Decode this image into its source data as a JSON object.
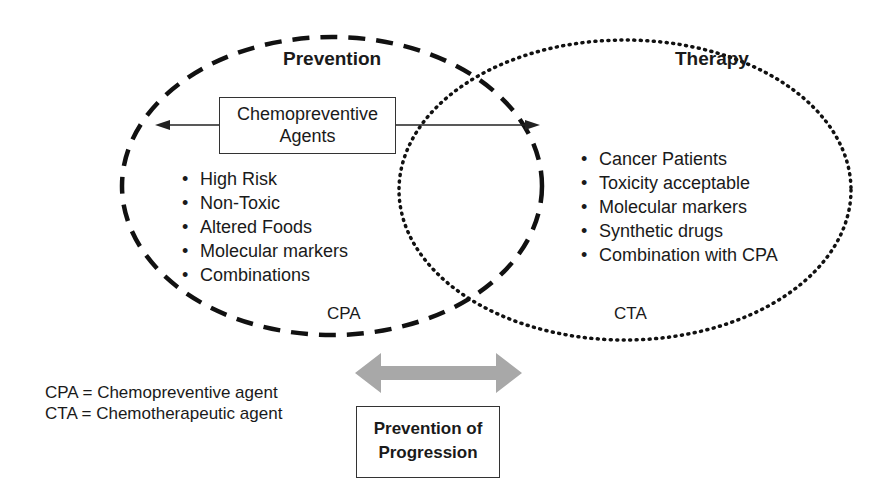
{
  "prevention": {
    "heading": "Prevention",
    "agents_box": {
      "line1": "Chemopreventive",
      "line2": "Agents"
    },
    "items": [
      "High Risk",
      "Non-Toxic",
      "Altered Foods",
      "Molecular markers",
      "Combinations"
    ],
    "label": "CPA"
  },
  "therapy": {
    "heading": "Therapy",
    "items": [
      "Cancer Patients",
      "Toxicity acceptable",
      "Molecular markers",
      "Synthetic drugs",
      "Combination with CPA"
    ],
    "label": "CTA"
  },
  "legend": {
    "cpa": "CPA = Chemopreventive agent",
    "cta": "CTA = Chemotherapeutic agent"
  },
  "progression_box": {
    "line1": "Prevention of",
    "line2": "Progression"
  },
  "colors": {
    "line": "#111111",
    "arrow_fill": "#a8a8a8"
  }
}
